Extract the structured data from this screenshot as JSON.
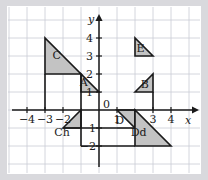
{
  "figure": {
    "background": "#d9d9dd",
    "paper": "#ffffff",
    "grid_color": "#c9ccd4",
    "axis_color": "#1a1a1a",
    "shape_fill": "#c3c3c3",
    "shape_stroke": "#1a1a1a"
  },
  "chart_data": {
    "type": "scatter",
    "title": "",
    "xlabel": "x",
    "ylabel": "y",
    "xlim": [
      -5,
      5
    ],
    "ylim": [
      -2.7,
      4.7
    ],
    "grid": true,
    "legend": "none",
    "x_ticks": [
      -4,
      -3,
      -2,
      1,
      3,
      4
    ],
    "x_tick_labels": [
      "−4",
      "−3",
      "−2",
      "1",
      "3",
      "4"
    ],
    "y_ticks": [
      4,
      3,
      2,
      1,
      0,
      -1,
      -2
    ],
    "y_tick_labels": [
      "4",
      "3",
      "2",
      "1",
      "0",
      "1",
      "−2"
    ],
    "origin_label": "0",
    "shapes": [
      {
        "name": "C",
        "label": "C",
        "label_xy": [
          -2.35,
          2.85
        ],
        "vertices": [
          [
            -3,
            4
          ],
          [
            -3,
            2
          ],
          [
            -1,
            2
          ]
        ]
      },
      {
        "name": "A",
        "label": "A",
        "label_xy": [
          -0.85,
          1.35
        ],
        "vertices": [
          [
            -1,
            2
          ],
          [
            -1,
            1
          ],
          [
            0,
            1
          ]
        ]
      },
      {
        "name": "Ch",
        "label": "Ch",
        "label_xy": [
          -2.05,
          -1.45
        ],
        "vertices": [
          [
            -2,
            -1
          ],
          [
            -1,
            0
          ],
          [
            -1,
            -1
          ]
        ]
      },
      {
        "name": "E",
        "label": "E",
        "label_xy": [
          2.3,
          3.25
        ],
        "vertices": [
          [
            2,
            4
          ],
          [
            2,
            3
          ],
          [
            3,
            3
          ]
        ]
      },
      {
        "name": "B",
        "label": "B",
        "label_xy": [
          2.55,
          1.25
        ],
        "vertices": [
          [
            2,
            1
          ],
          [
            3,
            2
          ],
          [
            3,
            1
          ]
        ]
      },
      {
        "name": "D",
        "label": "D",
        "label_xy": [
          1.15,
          -0.75
        ],
        "vertices": [
          [
            1,
            0
          ],
          [
            2,
            0
          ],
          [
            2,
            -1
          ]
        ]
      },
      {
        "name": "Dd",
        "label": "Dd",
        "label_xy": [
          2.2,
          -1.45
        ],
        "vertices": [
          [
            2,
            0
          ],
          [
            2,
            -2
          ],
          [
            4,
            -2
          ]
        ]
      }
    ],
    "connector_lines": [
      {
        "name": "c-left-leg",
        "from": [
          -3,
          2
        ],
        "to": [
          -3,
          0
        ]
      },
      {
        "name": "a-left-leg",
        "from": [
          -1,
          2
        ],
        "to": [
          -1,
          0
        ]
      },
      {
        "name": "ch-lower-edge",
        "from": [
          -2,
          -1
        ],
        "to": [
          1,
          -1
        ]
      },
      {
        "name": "d-lower-edge",
        "from": [
          1,
          -1
        ],
        "to": [
          2,
          -1
        ]
      },
      {
        "name": "b-right-leg",
        "from": [
          3,
          1
        ],
        "to": [
          3,
          0
        ]
      },
      {
        "name": "dd-bottom-edge",
        "from": [
          -1,
          -2
        ],
        "to": [
          2,
          -2
        ]
      },
      {
        "name": "ch-left-drop",
        "from": [
          -1,
          0
        ],
        "to": [
          -1,
          -2
        ]
      }
    ]
  }
}
